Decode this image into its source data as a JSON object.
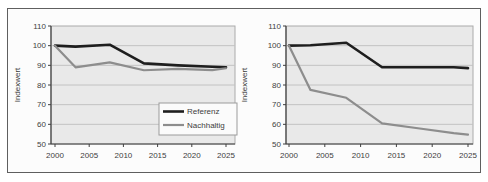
{
  "figure": {
    "background": "#fcfcfc",
    "border_color": "#5f5f5f"
  },
  "colors": {
    "plot_bg": "#e9e9e9",
    "gridline": "#c2c2c2",
    "plot_border": "#aaaaaa",
    "axis": "#3f3f3f",
    "text": "#404040",
    "referenz": "#1e1e1e",
    "nachhaltig": "#8d8d8d",
    "legend_bg": "#fbfbfb",
    "legend_border": "#9b9b9b"
  },
  "chart_data": [
    {
      "type": "line",
      "title": "",
      "xlabel": "",
      "ylabel": "Indexwert",
      "ylim": [
        50,
        110
      ],
      "yticks": [
        50,
        60,
        70,
        80,
        90,
        100,
        110
      ],
      "xticks": [
        2000,
        2005,
        2010,
        2015,
        2020,
        2025
      ],
      "grid": true,
      "x": [
        2000,
        2003,
        2008,
        2013,
        2018,
        2023,
        2025
      ],
      "series": [
        {
          "name": "Referenz",
          "color_key": "referenz",
          "width": 2.6,
          "values": [
            100,
            99.5,
            100.5,
            91,
            90,
            89.3,
            89
          ]
        },
        {
          "name": "Nachhaltig",
          "color_key": "nachhaltig",
          "width": 2.2,
          "values": [
            100,
            89,
            91.5,
            87.5,
            88.2,
            87.6,
            88.5
          ]
        }
      ],
      "legend": {
        "visible": true,
        "position": "bottom-right",
        "entries": [
          "Referenz",
          "Nachhaltig"
        ]
      }
    },
    {
      "type": "line",
      "title": "",
      "xlabel": "",
      "ylabel": "Indexwert",
      "ylim": [
        50,
        110
      ],
      "yticks": [
        50,
        60,
        70,
        80,
        90,
        100,
        110
      ],
      "xticks": [
        2000,
        2005,
        2010,
        2015,
        2020,
        2025
      ],
      "grid": true,
      "x": [
        2000,
        2003,
        2008,
        2013,
        2018,
        2023,
        2025
      ],
      "series": [
        {
          "name": "Referenz",
          "color_key": "referenz",
          "width": 2.6,
          "values": [
            100,
            100.2,
            101.5,
            89,
            89,
            89,
            88.6
          ]
        },
        {
          "name": "Nachhaltig",
          "color_key": "nachhaltig",
          "width": 2.2,
          "values": [
            100,
            77.5,
            73.5,
            60.5,
            58,
            55.5,
            54.8
          ]
        }
      ],
      "legend": {
        "visible": false,
        "position": "none",
        "entries": []
      }
    }
  ]
}
